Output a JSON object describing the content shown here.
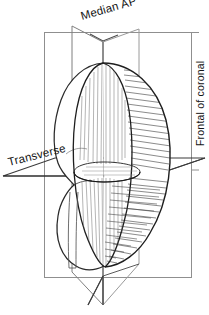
{
  "figure": {
    "background_color": "#ffffff",
    "ink_color": "#1a1a1a",
    "frame_color": "#8c8c8c",
    "hatch_color": "#2b2b2b",
    "labels": {
      "median": "Median AP",
      "transverse": "Transverse",
      "coronal": "Frontal of coronal"
    },
    "planes": [
      {
        "name": "median-sagittal-plane",
        "label": "Median AP",
        "orientation": "vertical-anteroposterior"
      },
      {
        "name": "transverse-plane",
        "label": "Transverse",
        "orientation": "horizontal"
      },
      {
        "name": "coronal-plane",
        "label": "Frontal of coronal",
        "orientation": "vertical-frontal"
      }
    ],
    "organ": {
      "name": "organ-body",
      "shading": "line-hatching",
      "sections": [
        "left-lobe-outline",
        "median-cut-surface",
        "right-hatched-lobe"
      ]
    }
  }
}
